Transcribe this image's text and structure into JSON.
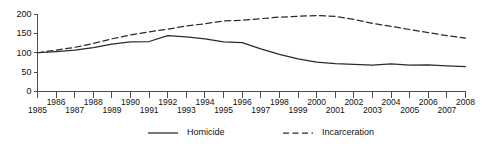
{
  "chart_data": {
    "type": "line",
    "title": "",
    "subtitle": "",
    "xlabel": "",
    "ylabel": "",
    "xlim": [
      1985,
      2008
    ],
    "ylim": [
      0,
      200
    ],
    "grid": false,
    "legend_position": "bottom",
    "ytick_labels": [
      "0",
      "50",
      "100",
      "150",
      "200"
    ],
    "yticks": [
      0,
      50,
      100,
      150,
      200
    ],
    "x": [
      1985,
      1986,
      1987,
      1988,
      1989,
      1990,
      1991,
      1992,
      1993,
      1994,
      1995,
      1996,
      1997,
      1998,
      1999,
      2000,
      2001,
      2002,
      2003,
      2004,
      2005,
      2006,
      2007,
      2008
    ],
    "xtick_labels": [
      "1985",
      "1986",
      "1987",
      "1988",
      "1989",
      "1990",
      "1991",
      "1992",
      "1993",
      "1994",
      "1995",
      "1996",
      "1997",
      "1998",
      "1999",
      "2000",
      "2001",
      "2002",
      "2003",
      "2004",
      "2005",
      "2006",
      "2007",
      "2008"
    ],
    "xtick_rows": [
      0,
      1,
      0,
      1,
      0,
      1,
      0,
      1,
      0,
      1,
      0,
      1,
      0,
      1,
      0,
      1,
      0,
      1,
      0,
      1,
      0,
      1,
      0,
      1
    ],
    "series": [
      {
        "name": "Homicide",
        "style": "solid",
        "color": "#2b2b2b",
        "values": [
          100,
          103,
          107,
          113,
          122,
          128,
          129,
          144,
          141,
          136,
          128,
          126,
          110,
          96,
          84,
          76,
          72,
          70,
          68,
          71,
          68,
          69,
          66,
          64
        ]
      },
      {
        "name": "Incarceration",
        "style": "dashed",
        "color": "#2b2b2b",
        "values": [
          100,
          107,
          114,
          124,
          136,
          146,
          154,
          161,
          169,
          175,
          182,
          184,
          188,
          192,
          194,
          196,
          194,
          186,
          176,
          168,
          160,
          152,
          144,
          138
        ]
      }
    ],
    "legend": [
      {
        "label": "Homicide",
        "style": "solid"
      },
      {
        "label": "Incarceration",
        "style": "dashed"
      }
    ]
  }
}
